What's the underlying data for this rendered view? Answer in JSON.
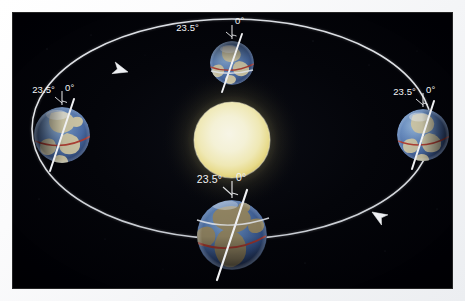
{
  "page": {
    "background_color": "#f2f3f6",
    "bleed_text": "                          "
  },
  "figure": {
    "name": "earth-orbit-seasons-diagram",
    "background_color": "#000105",
    "orbit": {
      "color": "#e8eaee",
      "center_x": 219,
      "center_y": 116,
      "radius_x": 200,
      "radius_y": 110,
      "direction": "counterclockwise",
      "arrows": [
        {
          "name": "orbit-arrow-left",
          "x": 115,
          "y": 59,
          "angle": 196
        },
        {
          "name": "orbit-arrow-right",
          "x": 359,
          "y": 199,
          "angle": 32
        }
      ]
    },
    "sun": {
      "label": "Sun",
      "center_x": 219,
      "center_y": 127,
      "radius": 38,
      "core_color": "#f5f3de",
      "mid_color": "#f2eec0",
      "edge_color": "#e8dd8e",
      "glow_color": "#5a5330"
    },
    "earths": [
      {
        "id": "earth-top",
        "name": "earth-top",
        "position": "top",
        "center_x": 219,
        "center_y": 50,
        "radius": 22,
        "axis_tilt_deg": 23.5,
        "tilt_label": "23.5°",
        "vertical_label": "0°",
        "ocean_color": "#4c6ea8",
        "land_color": "#d9cfa8",
        "equator_color": "#b03a2e",
        "axis_color": "#f0f1f3"
      },
      {
        "id": "earth-left",
        "name": "earth-left",
        "position": "left",
        "center_x": 49,
        "center_y": 122,
        "radius": 28,
        "axis_tilt_deg": 23.5,
        "tilt_label": "23.5°",
        "vertical_label": "0°",
        "ocean_color": "#4c6ea8",
        "land_color": "#d9cfa8",
        "equator_color": "#b03a2e",
        "axis_color": "#f0f1f3"
      },
      {
        "id": "earth-right",
        "name": "earth-right",
        "position": "right",
        "center_x": 410,
        "center_y": 122,
        "radius": 26,
        "axis_tilt_deg": 23.5,
        "tilt_label": "23.5°",
        "vertical_label": "0°",
        "ocean_color": "#4c6ea8",
        "land_color": "#d9cfa8",
        "equator_color": "#b03a2e",
        "axis_color": "#f0f1f3"
      },
      {
        "id": "earth-bottom",
        "name": "earth-bottom",
        "position": "bottom",
        "center_x": 219,
        "center_y": 222,
        "radius": 35,
        "axis_tilt_deg": 23.5,
        "tilt_label": "23.5°",
        "vertical_label": "0°",
        "ocean_color": "#3f5f96",
        "land_color": "#97875f",
        "equator_color": "#a8362b",
        "axis_color": "#f0f1f3"
      }
    ]
  }
}
